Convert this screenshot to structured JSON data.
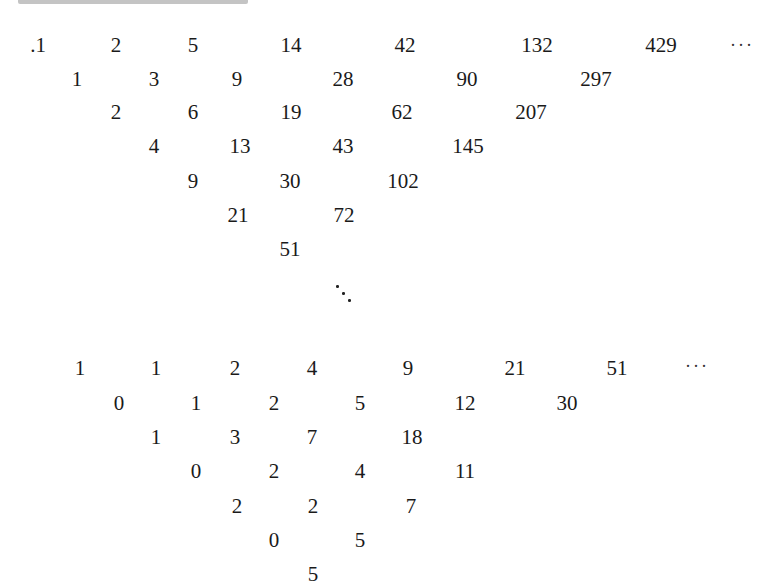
{
  "header_fragment": {
    "note": "clipped text line at top edge (unreadable)"
  },
  "triangle_top": {
    "rows": [
      {
        "y": 45,
        "cells": [
          {
            "x": 38,
            "v": ".1"
          },
          {
            "x": 116,
            "v": "2"
          },
          {
            "x": 193,
            "v": "5"
          },
          {
            "x": 291,
            "v": "14"
          },
          {
            "x": 405,
            "v": "42"
          },
          {
            "x": 537,
            "v": "132"
          },
          {
            "x": 661,
            "v": "429"
          }
        ]
      },
      {
        "y": 79,
        "cells": [
          {
            "x": 77,
            "v": "1"
          },
          {
            "x": 154,
            "v": "3"
          },
          {
            "x": 237,
            "v": "9"
          },
          {
            "x": 343,
            "v": "28"
          },
          {
            "x": 467,
            "v": "90"
          },
          {
            "x": 596,
            "v": "297"
          }
        ]
      },
      {
        "y": 112,
        "cells": [
          {
            "x": 116,
            "v": "2"
          },
          {
            "x": 193,
            "v": "6"
          },
          {
            "x": 291,
            "v": "19"
          },
          {
            "x": 402,
            "v": "62"
          },
          {
            "x": 531,
            "v": "207"
          }
        ]
      },
      {
        "y": 146,
        "cells": [
          {
            "x": 154,
            "v": "4"
          },
          {
            "x": 240,
            "v": "13"
          },
          {
            "x": 343,
            "v": "43"
          },
          {
            "x": 468,
            "v": "145"
          }
        ]
      },
      {
        "y": 181,
        "cells": [
          {
            "x": 193,
            "v": "9"
          },
          {
            "x": 290,
            "v": "30"
          },
          {
            "x": 403,
            "v": "102"
          }
        ]
      },
      {
        "y": 215,
        "cells": [
          {
            "x": 238,
            "v": "21"
          },
          {
            "x": 344,
            "v": "72"
          }
        ]
      },
      {
        "y": 249,
        "cells": [
          {
            "x": 290,
            "v": "51"
          }
        ]
      }
    ],
    "row_ellipsis": {
      "x": 742,
      "y": 45,
      "v": "···"
    },
    "diag_ellipsis": {
      "x": 336,
      "y": 285
    }
  },
  "triangle_bottom": {
    "rows": [
      {
        "y": 368,
        "cells": [
          {
            "x": 80,
            "v": "1"
          },
          {
            "x": 156,
            "v": "1"
          },
          {
            "x": 235,
            "v": "2"
          },
          {
            "x": 312,
            "v": "4"
          },
          {
            "x": 408,
            "v": "9"
          },
          {
            "x": 515,
            "v": "21"
          },
          {
            "x": 617,
            "v": "51"
          }
        ]
      },
      {
        "y": 403,
        "cells": [
          {
            "x": 119,
            "v": "0"
          },
          {
            "x": 196,
            "v": "1"
          },
          {
            "x": 274,
            "v": "2"
          },
          {
            "x": 360,
            "v": "5"
          },
          {
            "x": 465,
            "v": "12"
          },
          {
            "x": 567,
            "v": "30"
          }
        ]
      },
      {
        "y": 437,
        "cells": [
          {
            "x": 156,
            "v": "1"
          },
          {
            "x": 235,
            "v": "3"
          },
          {
            "x": 312,
            "v": "7"
          },
          {
            "x": 412,
            "v": "18"
          }
        ]
      },
      {
        "y": 471,
        "cells": [
          {
            "x": 196,
            "v": "0"
          },
          {
            "x": 274,
            "v": "2"
          },
          {
            "x": 360,
            "v": "4"
          },
          {
            "x": 465,
            "v": "11"
          }
        ]
      },
      {
        "y": 506,
        "cells": [
          {
            "x": 237,
            "v": "2"
          },
          {
            "x": 313,
            "v": "2"
          },
          {
            "x": 411,
            "v": "7"
          }
        ]
      },
      {
        "y": 540,
        "cells": [
          {
            "x": 274,
            "v": "0"
          },
          {
            "x": 360,
            "v": "5"
          }
        ]
      },
      {
        "y": 574,
        "cells": [
          {
            "x": 313,
            "v": "5"
          }
        ]
      }
    ],
    "row_ellipsis": {
      "x": 697,
      "y": 366,
      "v": "···"
    }
  }
}
